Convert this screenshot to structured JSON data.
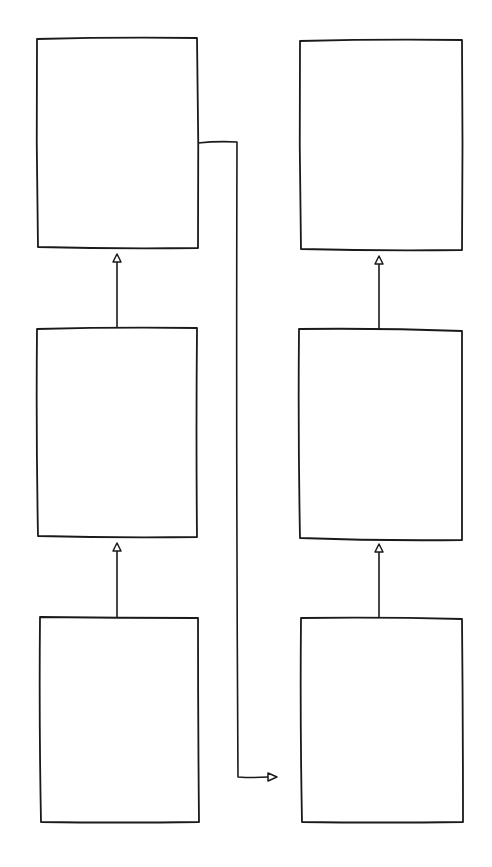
{
  "diagram": {
    "style": "hand-drawn sketch",
    "stroke_color": "#1a1a1a",
    "background": "#ffffff",
    "columns": [
      {
        "id": "left",
        "boxes": [
          {
            "id": "left-top",
            "label": ""
          },
          {
            "id": "left-middle",
            "label": ""
          },
          {
            "id": "left-bottom",
            "label": ""
          }
        ]
      },
      {
        "id": "right",
        "boxes": [
          {
            "id": "right-top",
            "label": ""
          },
          {
            "id": "right-middle",
            "label": ""
          },
          {
            "id": "right-bottom",
            "label": ""
          }
        ]
      }
    ],
    "edges": [
      {
        "from": "left-bottom",
        "to": "left-middle",
        "arrow": "hollow-triangle"
      },
      {
        "from": "left-middle",
        "to": "left-top",
        "arrow": "hollow-triangle"
      },
      {
        "from": "right-bottom",
        "to": "right-middle",
        "arrow": "hollow-triangle"
      },
      {
        "from": "right-middle",
        "to": "right-top",
        "arrow": "hollow-triangle"
      },
      {
        "from": "left-top",
        "to": "right-bottom",
        "arrow": "hollow-triangle",
        "routing": "orthogonal"
      }
    ]
  }
}
